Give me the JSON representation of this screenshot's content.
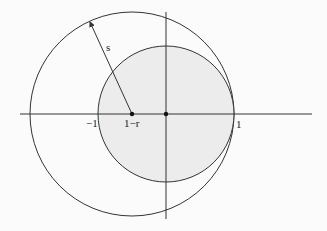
{
  "diagram": {
    "colors": {
      "stroke": "#333333",
      "fill_small_disk": "#ececec",
      "background": "#fbfbfb"
    },
    "labels": {
      "minus_one": "−1",
      "one_minus_r": "1−r",
      "one": "1",
      "radius": "s"
    },
    "geometry": {
      "origin": [
        166,
        114
      ],
      "unit_radius_px": 68,
      "big_center": [
        132,
        114
      ],
      "big_radius_px": 102,
      "x_axis": [
        20,
        312
      ],
      "y_axis": [
        12,
        219
      ],
      "radius_arrow_end": [
        90,
        22
      ]
    }
  }
}
